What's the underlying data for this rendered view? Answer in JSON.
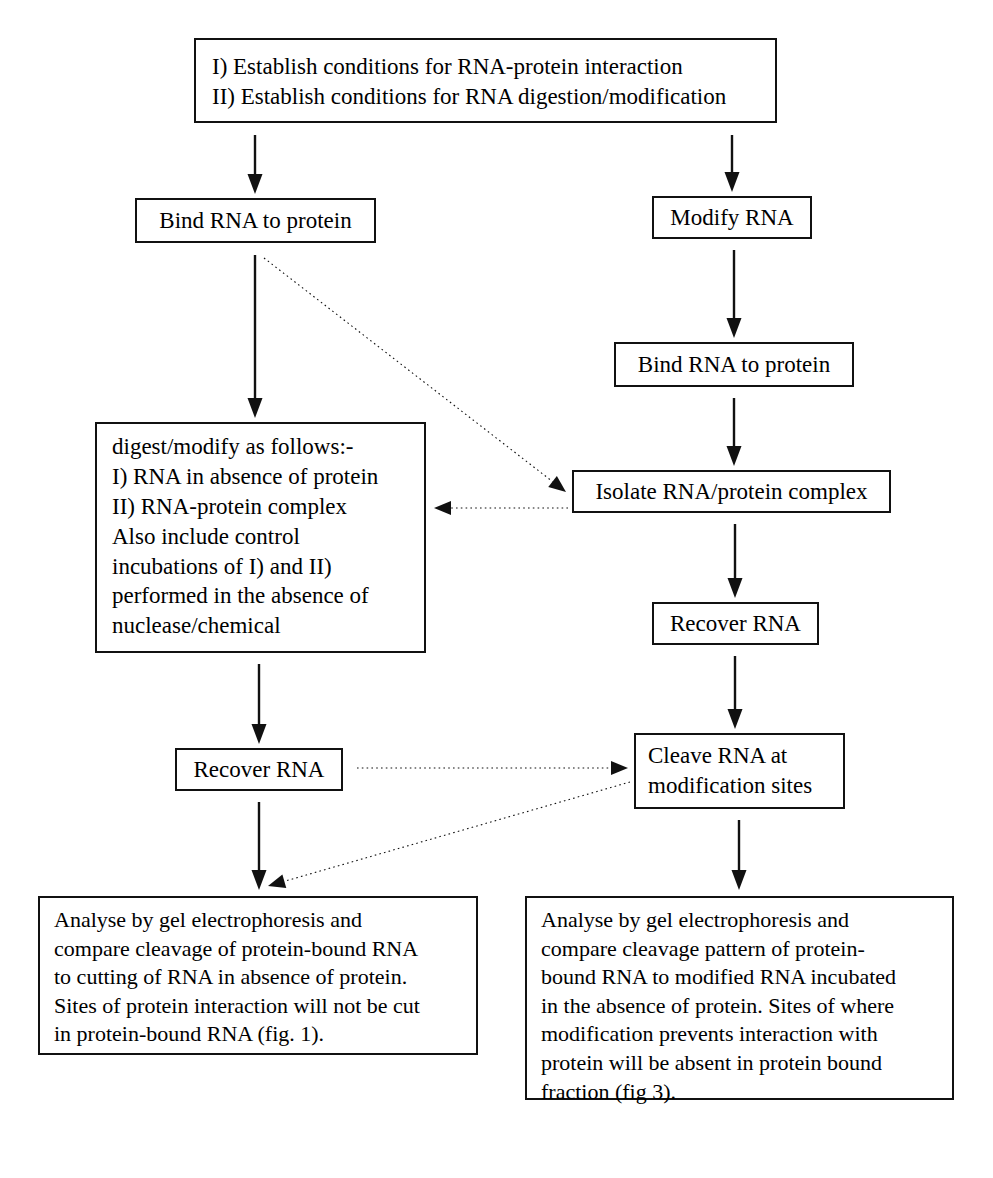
{
  "diagram": {
    "background_color": "#ffffff",
    "line_color": "#111111",
    "nodes": [
      {
        "id": "establish",
        "text": "I) Establish conditions for RNA-protein interaction\nII) Establish conditions for RNA digestion/modification",
        "x": 194,
        "y": 38,
        "w": 583,
        "h": 85,
        "font_size": 23,
        "padding": "12px 16px",
        "align": "left"
      },
      {
        "id": "bind-left",
        "text": "Bind RNA to protein",
        "x": 135,
        "y": 198,
        "w": 241,
        "h": 45,
        "font_size": 23,
        "padding": "0 12px",
        "align": "center"
      },
      {
        "id": "modify-rna",
        "text": "Modify RNA",
        "x": 652,
        "y": 196,
        "w": 160,
        "h": 43,
        "font_size": 23,
        "padding": "0 12px",
        "align": "center"
      },
      {
        "id": "bind-right",
        "text": "Bind RNA to protein",
        "x": 614,
        "y": 342,
        "w": 240,
        "h": 45,
        "font_size": 23,
        "padding": "0 12px",
        "align": "center"
      },
      {
        "id": "digest-modify",
        "text": "digest/modify as follows:-\nI) RNA in absence of protein\nII) RNA-protein complex\nAlso include control\nincubations of I) and II)\nperformed in the absence of\nnuclease/chemical",
        "x": 95,
        "y": 422,
        "w": 331,
        "h": 231,
        "font_size": 23,
        "padding": "8px 0 8px 15px",
        "align": "left"
      },
      {
        "id": "isolate-complex",
        "text": "Isolate RNA/protein complex",
        "x": 572,
        "y": 470,
        "w": 319,
        "h": 43,
        "font_size": 23,
        "padding": "0 12px",
        "align": "center"
      },
      {
        "id": "recover-rna-right",
        "text": "Recover RNA",
        "x": 652,
        "y": 602,
        "w": 167,
        "h": 43,
        "font_size": 23,
        "padding": "0 12px",
        "align": "center"
      },
      {
        "id": "recover-rna-left",
        "text": "Recover RNA",
        "x": 175,
        "y": 748,
        "w": 168,
        "h": 43,
        "font_size": 23,
        "padding": "0 12px",
        "align": "center"
      },
      {
        "id": "cleave-rna",
        "text": "Cleave RNA at\nmodification sites",
        "x": 634,
        "y": 733,
        "w": 211,
        "h": 76,
        "font_size": 23,
        "padding": "6px 0 6px 12px",
        "align": "left"
      },
      {
        "id": "analyse-left",
        "text": "Analyse by gel electrophoresis and\ncompare cleavage of protein-bound RNA\nto cutting of RNA in absence of protein.\nSites of protein interaction will not be cut\nin protein-bound RNA (fig. 1).",
        "x": 38,
        "y": 896,
        "w": 440,
        "h": 159,
        "font_size": 22,
        "padding": "8px 0 8px 14px",
        "align": "left"
      },
      {
        "id": "analyse-right",
        "text": "Analyse by gel electrophoresis and\ncompare cleavage pattern of protein-\nbound RNA to modified RNA incubated\nin the absence of protein.  Sites of where\nmodification prevents interaction with\nprotein will be absent in protein bound\nfraction (fig 3).",
        "x": 525,
        "y": 896,
        "w": 429,
        "h": 204,
        "font_size": 22,
        "padding": "8px 0 8px 14px",
        "align": "left"
      }
    ],
    "edges": [
      {
        "id": "establish-to-bind-left",
        "style": "solid",
        "x1": 255,
        "y1": 135,
        "x2": 255,
        "y2": 194
      },
      {
        "id": "establish-to-modify",
        "style": "solid",
        "x1": 732,
        "y1": 135,
        "x2": 732,
        "y2": 192
      },
      {
        "id": "bind-left-to-digest",
        "style": "solid",
        "x1": 255,
        "y1": 255,
        "x2": 255,
        "y2": 418
      },
      {
        "id": "modify-to-bind-right",
        "style": "solid",
        "x1": 734,
        "y1": 250,
        "x2": 734,
        "y2": 338
      },
      {
        "id": "bind-right-to-isolate",
        "style": "solid",
        "x1": 734,
        "y1": 398,
        "x2": 734,
        "y2": 466
      },
      {
        "id": "isolate-to-recover-right",
        "style": "solid",
        "x1": 735,
        "y1": 524,
        "x2": 735,
        "y2": 598
      },
      {
        "id": "recover-right-to-cleave",
        "style": "solid",
        "x1": 735,
        "y1": 656,
        "x2": 735,
        "y2": 729
      },
      {
        "id": "digest-to-recover-left",
        "style": "solid",
        "x1": 259,
        "y1": 664,
        "x2": 259,
        "y2": 744
      },
      {
        "id": "recover-left-to-analyse-left",
        "style": "solid",
        "x1": 259,
        "y1": 802,
        "x2": 259,
        "y2": 890
      },
      {
        "id": "cleave-to-analyse-right",
        "style": "solid",
        "x1": 739,
        "y1": 820,
        "x2": 739,
        "y2": 890
      },
      {
        "id": "bind-left-to-isolate-dotted",
        "style": "dotted",
        "x1": 264,
        "y1": 258,
        "x2": 566,
        "y2": 492
      },
      {
        "id": "isolate-to-digest-dotted",
        "style": "dotted",
        "x1": 568,
        "y1": 508,
        "x2": 434,
        "y2": 508
      },
      {
        "id": "recover-left-to-cleave-dotted",
        "style": "dotted",
        "x1": 357,
        "y1": 768,
        "x2": 628,
        "y2": 768
      },
      {
        "id": "cleave-to-analyse-left-dotted",
        "style": "dotted",
        "x1": 630,
        "y1": 782,
        "x2": 268,
        "y2": 886
      }
    ]
  }
}
